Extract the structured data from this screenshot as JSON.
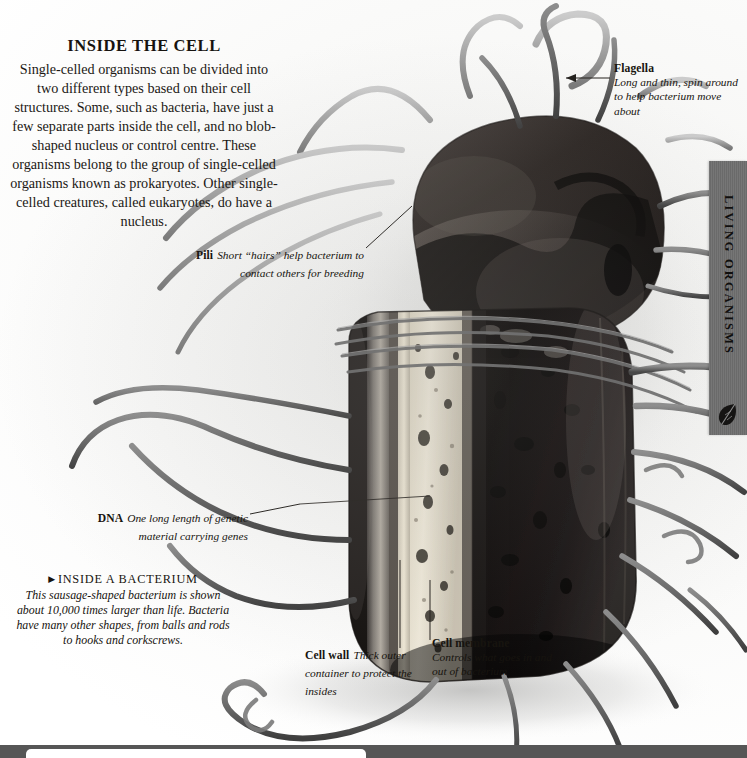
{
  "page": {
    "background_color": "#fdfdfc",
    "width": 747,
    "height": 758
  },
  "intro": {
    "title": "INSIDE THE CELL",
    "body": "Single-celled organisms can be divided into two different types based on their cell structures. Some, such as bacteria, have just a few separate parts inside the cell, and no blob-shaped nucleus or control centre. These organisms belong to the group of single-celled organisms known as prokaryotes. Other single-celled creatures, called eukaryotes, do have a nucleus."
  },
  "labels": {
    "flagella": {
      "head": "Flagella",
      "desc": "Long and thin, spin around to help bacterium move about"
    },
    "pili": {
      "head": "Pili",
      "desc": "Short “hairs” help bacterium to contact others for breeding"
    },
    "dna": {
      "head": "DNA",
      "desc": "One long length of genetic material carrying genes"
    },
    "cell_wall": {
      "head": "Cell wall",
      "desc": "Thick outer container to protect the insides"
    },
    "cell_membrane": {
      "head": "Cell membrane",
      "desc": "Controls what goes in and out of bacterium"
    }
  },
  "caption": {
    "arrow": "▶",
    "title": "INSIDE A BACTERIUM",
    "body": "This sausage-shaped bacterium is shown about 10,000 times larger than life. Bacteria have many other shapes, from balls and rods to hooks and corkscrews."
  },
  "side_tab": {
    "label": "LIVING ORGANISMS",
    "icon": "leaf-icon",
    "background_color": "#6f6f6f",
    "text_color": "#100f0e"
  },
  "bottom_bar": {
    "color": "#565656"
  },
  "illustration": {
    "subject": "cutaway-bacterium-photograph",
    "elements": [
      "bacterium-body",
      "bacterium-dome",
      "cell-wall-layer",
      "cell-membrane-layer",
      "cytoplasm-dna",
      "flagella-strands",
      "pili-strands"
    ]
  }
}
